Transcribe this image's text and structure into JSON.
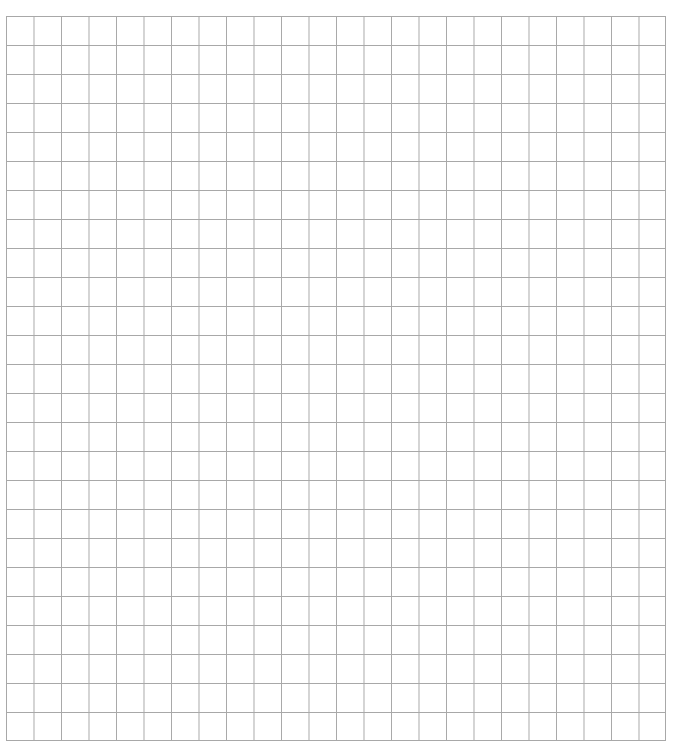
{
  "page": {
    "type": "graph-paper-worksheet",
    "background_color": "#ffffff"
  },
  "grid": {
    "columns": 24,
    "rows": 25,
    "cell_width_px": 27.5,
    "cell_height_px": 29,
    "left_px": 6,
    "top_px": 16,
    "width_px": 660,
    "height_px": 725,
    "line_color": "#a8a8a8",
    "cells_filled": []
  },
  "header": {
    "text": ""
  }
}
